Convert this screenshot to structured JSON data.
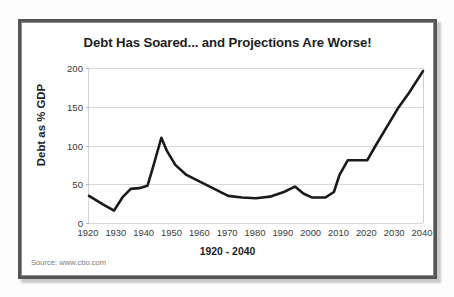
{
  "chart_data": {
    "type": "line",
    "title": "Debt Has Soared... and Projections Are Worse!",
    "xlabel": "1920 - 2040",
    "ylabel": "Debt as % GDP",
    "xlim": [
      1920,
      2040
    ],
    "ylim": [
      0,
      200
    ],
    "grid": true,
    "legend": false,
    "x_tick_labels": [
      "1920",
      "1930",
      "1940",
      "1950",
      "1960",
      "1970",
      "1980",
      "1990",
      "2000",
      "2010",
      "2020",
      "2030",
      "2040"
    ],
    "y_tick_labels": [
      "0",
      "50",
      "100",
      "150",
      "200"
    ],
    "y_ticks": [
      0,
      50,
      100,
      150,
      200
    ],
    "series": [
      {
        "name": "Debt as % GDP",
        "color": "#1a1a1a",
        "x": [
          1920,
          1925,
          1929,
          1932,
          1935,
          1938,
          1941,
          1943,
          1946,
          1948,
          1951,
          1955,
          1960,
          1965,
          1970,
          1975,
          1980,
          1985,
          1990,
          1994,
          1997,
          2000,
          2002,
          2005,
          2008,
          2010,
          2013,
          2016,
          2020,
          2023,
          2027,
          2031,
          2035,
          2040
        ],
        "y": [
          35,
          24,
          16,
          33,
          44,
          45,
          48,
          72,
          110,
          93,
          75,
          62,
          53,
          44,
          35,
          33,
          32,
          34,
          40,
          47,
          38,
          33,
          33,
          33,
          40,
          62,
          81,
          81,
          81,
          100,
          124,
          148,
          168,
          196
        ]
      }
    ],
    "annotations": {
      "source": "Source: www.cbo.com"
    }
  },
  "frame": {
    "border_color": "#555555",
    "inner_border_color": "#8d8d8d"
  }
}
